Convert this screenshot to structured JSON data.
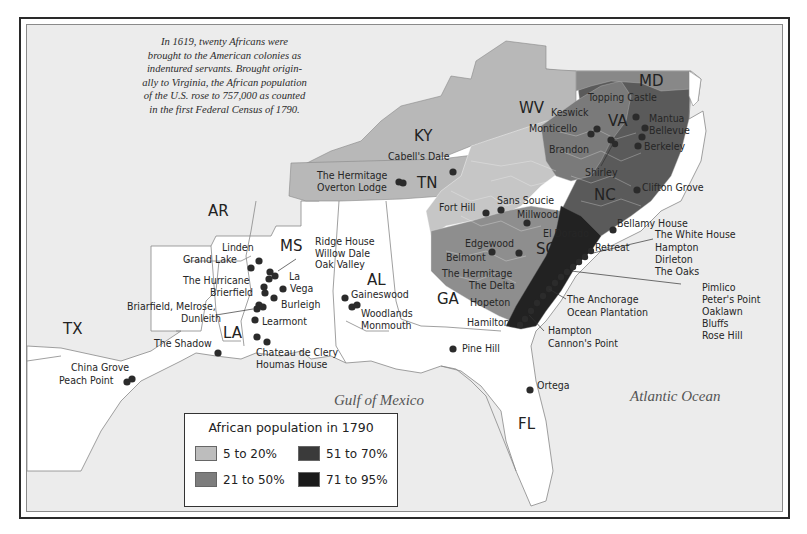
{
  "intro_text": "In 1619, twenty Africans were brought to the American colonies as indentured servants. Brought originally to Virginia, the African population of the U.S. rose to 757,000 as counted in the first Federal Census of 1790.",
  "intro_lines": [
    "In 1619, twenty Africans were",
    "brought to the American colonies as",
    "indentured servants. Brought origin-",
    "ally to Virginia, the African population",
    "of the U.S. rose to 757,000 as counted",
    "in the first Federal Census of 1790."
  ],
  "states": {
    "ky": "KY",
    "wv": "WV",
    "md": "MD",
    "va": "VA",
    "tn": "TN",
    "nc": "NC",
    "ar": "AR",
    "ms": "MS",
    "al": "AL",
    "sc": "SC",
    "ga": "GA",
    "la": "LA",
    "tx": "TX",
    "fl": "FL"
  },
  "water": {
    "gulf": "Gulf of Mexico",
    "atlantic": "Atlantic Ocean"
  },
  "legend": {
    "title": "African population in 1790",
    "items": [
      {
        "label": "5 to 20%",
        "color": "#bdbdbd"
      },
      {
        "label": "51 to 70%",
        "color": "#3a3a3a"
      },
      {
        "label": "21 to 50%",
        "color": "#7d7d7d"
      },
      {
        "label": "71 to 95%",
        "color": "#1a1a1a"
      }
    ]
  },
  "labels": {
    "cabells_dale": "Cabell's Dale",
    "topping_castle": "Topping Castle",
    "keswick": "Keswick",
    "monticello": "Monticello",
    "mantua": "Mantua",
    "bellevue": "Bellevue",
    "brandon": "Brandon",
    "berkeley": "Berkeley",
    "shirley": "Shirley",
    "clifton_grove": "Clifton Grove",
    "hermitage_tn": "The Hermitage",
    "overton_lodge": "Overton Lodge",
    "fort_hill": "Fort Hill",
    "sans_soucie": "Sans Soucie",
    "millwood": "Millwood",
    "bellamy_house": "Bellamy House",
    "el_dorado": "El Dorado",
    "retreat": "Retreat",
    "edgewood": "Edgewood",
    "belmont": "Belmont",
    "hermitage_ga": "The Hermitage",
    "the_delta": "The Delta",
    "hopeton": "Hopeton",
    "hamilton": "Hamilton",
    "white_house_group": [
      "The White House",
      "Hampton",
      "Dirleton",
      "The Oaks"
    ],
    "anchorage_group": [
      "The Anchorage",
      "Ocean Plantation"
    ],
    "pimlico_group": [
      "Pimlico",
      "Peter's Point",
      "Oaklawn",
      "Bluffs",
      "Rose Hill"
    ],
    "hampton_group": [
      "Hampton",
      "Cannon's Point"
    ],
    "pine_hill": "Pine Hill",
    "ortega": "Ortega",
    "linden": "Linden",
    "grand_lake": "Grand Lake",
    "ridge_group": [
      "Ridge House",
      "Willow Dale",
      "Oak Valley"
    ],
    "the_hurricane": "The Hurricane",
    "brierfield": "Brierfield",
    "la_vega": [
      "La",
      "Vega"
    ],
    "burleigh": "Burleigh",
    "briarfield_group": [
      "Briarfield, Melrose,",
      "Dunleith"
    ],
    "learmont": "Learmont",
    "gaineswood": "Gaineswood",
    "woodlands_group": [
      "Woodlands",
      "Monmouth"
    ],
    "the_shadow": "The Shadow",
    "chateau_group": [
      "Chateau de Clery",
      "Houmas House"
    ],
    "china_grove": "China Grove",
    "peach_point": "Peach Point"
  }
}
